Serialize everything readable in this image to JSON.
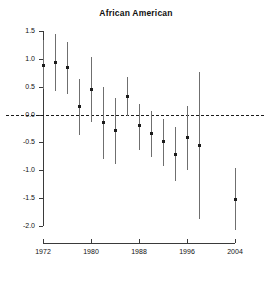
{
  "chart_data": {
    "type": "scatter",
    "title": "African American",
    "xlabel": "",
    "ylabel": "",
    "xlim": [
      1971,
      2005
    ],
    "ylim": [
      -2.0,
      1.5
    ],
    "grid": false,
    "legend": null,
    "yticks": [
      "1.5",
      "1.0",
      "0.5",
      "0.0",
      "-0.5",
      "-1.0",
      "-1.5",
      "-2.0"
    ],
    "ytick_values": [
      1.5,
      1.0,
      0.5,
      0.0,
      -0.5,
      -1.0,
      -1.5,
      -2.0
    ],
    "xticks": [
      "1972",
      "1980",
      "1988",
      "1996",
      "2004"
    ],
    "xtick_values": [
      1972,
      1980,
      1988,
      1996,
      2004
    ],
    "reference_line": {
      "y": 0.0,
      "style": "dashed"
    },
    "series": [
      {
        "name": "African American estimate with confidence interval",
        "x": [
          1972,
          1974,
          1976,
          1978,
          1980,
          1982,
          1984,
          1986,
          1988,
          1990,
          1992,
          1994,
          1996,
          1998,
          2004
        ],
        "values": [
          0.88,
          0.93,
          0.84,
          0.14,
          0.45,
          -0.15,
          -0.29,
          0.32,
          -0.2,
          -0.34,
          -0.48,
          -0.71,
          -0.41,
          -0.56,
          -1.52
        ],
        "ci_low": [
          0.45,
          0.42,
          0.37,
          -0.36,
          -0.13,
          -0.8,
          -0.89,
          -0.02,
          -0.63,
          -0.77,
          -0.92,
          -1.19,
          -1.0,
          -1.87,
          -2.08
        ],
        "ci_high": [
          1.33,
          1.45,
          1.31,
          0.63,
          1.04,
          0.49,
          0.3,
          0.68,
          0.19,
          0.06,
          -0.08,
          -0.23,
          0.16,
          0.77,
          -0.96
        ]
      }
    ]
  }
}
